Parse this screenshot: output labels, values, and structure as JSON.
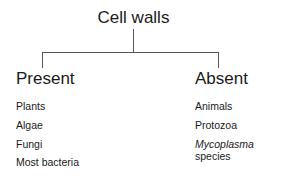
{
  "diagram": {
    "root": "Cell walls",
    "branches": [
      {
        "label": "Present",
        "items": [
          "Plants",
          "Algae",
          "Fungi",
          "Most bacteria"
        ]
      },
      {
        "label": "Absent",
        "items": [
          "Animals",
          "Protozoa"
        ],
        "special_item": {
          "italic": "Mycoplasma",
          "rest": " species"
        }
      }
    ]
  }
}
